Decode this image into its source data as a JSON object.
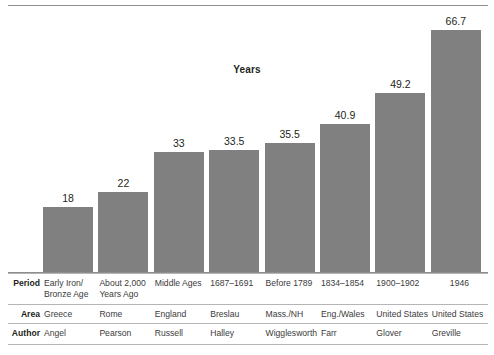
{
  "chart_data": {
    "type": "bar",
    "title": "Years",
    "xlabel": "",
    "ylabel": "Years",
    "ylim": [
      0,
      66.7
    ],
    "grid": false,
    "legend": "none",
    "categories": [
      "Early Iron/ Bronze Age",
      "About 2,000 Years Ago",
      "Middle Ages",
      "1687–1691",
      "Before 1789",
      "1834–1854",
      "1900–1902",
      "1946"
    ],
    "values": [
      18,
      22,
      33,
      33.5,
      35.5,
      40.9,
      49.2,
      66.7
    ],
    "value_labels": [
      "18",
      "22",
      "33",
      "33.5",
      "35.5",
      "40.9",
      "49.2",
      "66.7"
    ],
    "bar_color": "#808080"
  },
  "chart": {
    "title": "Years"
  },
  "table": {
    "rows": [
      {
        "header": "Period",
        "cells": [
          "Early Iron/\nBronze Age",
          "About 2,000\nYears Ago",
          "Middle Ages",
          "1687–1691",
          "Before 1789",
          "1834–1854",
          "1900–1902",
          "1946"
        ]
      },
      {
        "header": "Area",
        "cells": [
          "Greece",
          "Rome",
          "England",
          "Breslau",
          "Mass./NH",
          "Eng./Wales",
          "United States",
          "United States"
        ]
      },
      {
        "header": "Author",
        "cells": [
          "Angel",
          "Pearson",
          "Russell",
          "Halley",
          "Wigglesworth",
          "Farr",
          "Glover",
          "Greville"
        ]
      }
    ]
  },
  "colors": {
    "bar": "#808080",
    "rule": "#8d8d8d",
    "text": "#231f20"
  }
}
